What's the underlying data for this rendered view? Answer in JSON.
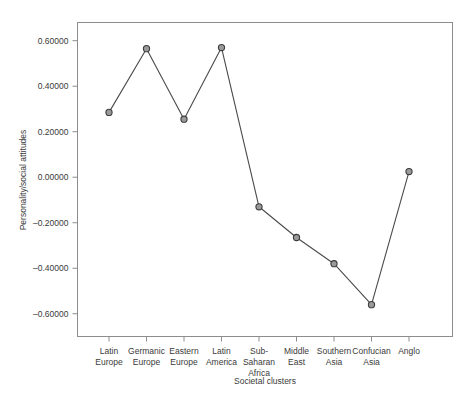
{
  "chart_data": {
    "type": "line",
    "title": "",
    "xlabel": "Societal clusters",
    "ylabel": "Personality/social attitudes",
    "categories": [
      "Latin Europe",
      "Germanic Europe",
      "Eastern Europe",
      "Latin America",
      "Sub-Saharan Africa",
      "Middle East",
      "Southern Asia",
      "Confucian Asia",
      "Anglo"
    ],
    "category_lines": [
      [
        "Latin",
        "Europe"
      ],
      [
        "Germanic",
        "Europe"
      ],
      [
        "Eastern",
        "Europe"
      ],
      [
        "Latin",
        "America"
      ],
      [
        "Sub-",
        "Saharan",
        "Africa"
      ],
      [
        "Middle",
        "East"
      ],
      [
        "Southern",
        "Asia"
      ],
      [
        "Confucian",
        "Asia"
      ],
      [
        "Anglo"
      ]
    ],
    "values": [
      0.285,
      0.565,
      0.255,
      0.57,
      -0.13,
      -0.265,
      -0.38,
      -0.56,
      0.025
    ],
    "ylim": [
      -0.7,
      0.68
    ],
    "ytick_values": [
      0.6,
      0.4,
      0.2,
      0.0,
      -0.2,
      -0.4,
      -0.6
    ],
    "ytick_labels": [
      "0.60000",
      "0.40000",
      "0.20000",
      "0.00000",
      "–0.20000",
      "–0.40000",
      "–0.60000"
    ],
    "grid": false,
    "legend": "none",
    "marker": "circle",
    "line_color": "#4a4a4a",
    "marker_fill": "#9a9a9a",
    "marker_stroke": "#3d3d3d",
    "frame_color": "#8d8d8d",
    "background": "#ffffff"
  }
}
